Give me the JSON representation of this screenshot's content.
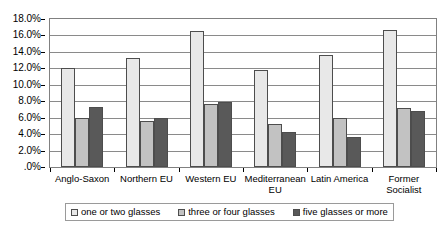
{
  "chart_data": {
    "type": "bar",
    "title": "",
    "subtitle": "",
    "xlabel": "",
    "ylabel": "",
    "ylim": [
      0,
      18
    ],
    "ytick_labels": [
      "18.0%",
      "16.0%",
      "14.0%",
      "12.0%",
      "10.0%",
      "8.0%",
      "6.0%",
      "4.0%",
      "2.0%",
      ".0%"
    ],
    "ytick_values": [
      18,
      16,
      14,
      12,
      10,
      8,
      6,
      4,
      2,
      0
    ],
    "grid": true,
    "legend_position": "bottom",
    "categories": [
      "Anglo-Saxon",
      "Northern EU",
      "Western EU",
      "Mediterranean EU",
      "Latin America",
      "Former Socialist"
    ],
    "series": [
      {
        "name": "one or two glasses",
        "color": "#e8e8e8",
        "values": [
          12.0,
          13.3,
          16.6,
          11.8,
          13.6,
          16.7
        ]
      },
      {
        "name": "three or four glasses",
        "color": "#c2c2c2",
        "values": [
          6.0,
          5.6,
          7.7,
          5.2,
          6.0,
          7.2
        ]
      },
      {
        "name": "five glasses or more",
        "color": "#595959",
        "values": [
          7.3,
          6.0,
          7.9,
          4.3,
          3.6,
          6.8
        ]
      }
    ]
  },
  "legend": {
    "entries": [
      {
        "label": "one or two glasses"
      },
      {
        "label": "three or four glasses"
      },
      {
        "label": "five glasses or more"
      }
    ]
  },
  "style": {
    "plot_border": "#808080",
    "gridline": "#8a8a8a",
    "bar_outline": "#4d4d4d",
    "text": "#000000",
    "background": "#ffffff"
  }
}
